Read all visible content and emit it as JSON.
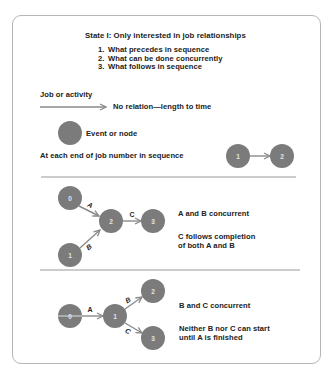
{
  "header": {
    "title": "State I: Only interested in job relationships",
    "list": [
      {
        "num": "1.",
        "text": "What precedes in sequence"
      },
      {
        "num": "2.",
        "text": "What can be done concurrently"
      },
      {
        "num": "3.",
        "text": "What follows in sequence"
      }
    ]
  },
  "legend": {
    "activity_label": "Job or activity",
    "activity_desc": "No relation—length to time",
    "event_label": "Event or node",
    "sequence_label": "At each end of job number in sequence",
    "sequence_nodes": [
      "1",
      "2"
    ]
  },
  "example_merge": {
    "nodes": [
      "0",
      "1",
      "2",
      "3"
    ],
    "edges": [
      "A",
      "B",
      "C"
    ],
    "note1": "A and B concurrent",
    "note2_line1": "C follows completion",
    "note2_line2": "of both A and B"
  },
  "example_burst": {
    "nodes": [
      "0",
      "1",
      "2",
      "3"
    ],
    "edges": [
      "A",
      "B",
      "C"
    ],
    "note1": "B and C concurrent",
    "note2_line1": "Neither B nor C can start",
    "note2_line2": "until A is finished"
  },
  "colors": {
    "node_fill": "#7b7b7b",
    "edge_stroke": "#8a8a8a",
    "frame_border": "#b5b5b5",
    "text": "#222222"
  }
}
